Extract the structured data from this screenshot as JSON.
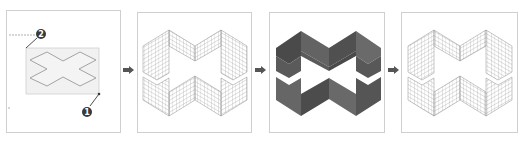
{
  "diagram": {
    "steps": [
      {
        "index": 1,
        "name": "sketch",
        "label": "Cross outline selection"
      },
      {
        "index": 2,
        "name": "wireframe",
        "label": "Extruded wireframe"
      },
      {
        "index": 3,
        "name": "shaded",
        "label": "Shaded solid"
      },
      {
        "index": 4,
        "name": "wireframe-result",
        "label": "Final wireframe"
      }
    ],
    "callouts": [
      {
        "id": "callout-1",
        "text": "1"
      },
      {
        "id": "callout-2",
        "text": "2"
      }
    ],
    "arrows": [
      "arrow-1",
      "arrow-2",
      "arrow-3"
    ],
    "colors": {
      "panel_border": "#cfcfcf",
      "outline": "#9a9a9a",
      "selection_fill": "#f1f1f1",
      "selection_border": "#d0d0d0",
      "wire": "#8c8c8c",
      "shade_dark": "#4a4a4a",
      "shade_mid": "#5e5e5e",
      "shade_light": "#6f6f6f",
      "arrow": "#555555",
      "badge": "#3a3a3a"
    }
  }
}
